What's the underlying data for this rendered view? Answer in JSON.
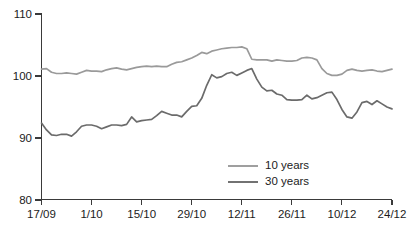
{
  "chart_data": {
    "type": "line",
    "title": "",
    "subtitle": "",
    "xlabel": "",
    "ylabel": "",
    "ylim": [
      80,
      110
    ],
    "yticks": [
      80,
      90,
      100,
      110
    ],
    "ytick_labels": [
      "80",
      "90",
      "100",
      "110"
    ],
    "grid": false,
    "legend_position": "inside-bottom-center",
    "xtick_labels": [
      "17/09",
      "1/10",
      "15/10",
      "29/10",
      "12/11",
      "26/11",
      "10/12",
      "24/12"
    ],
    "xtick_index": [
      0,
      10,
      20,
      30,
      40,
      50,
      60,
      70
    ],
    "x_count": 71,
    "series": [
      {
        "name": "10 years",
        "color": "#9a9a9a",
        "values": [
          101.1,
          101.2,
          100.6,
          100.4,
          100.4,
          100.5,
          100.4,
          100.3,
          100.6,
          100.9,
          100.8,
          100.8,
          100.7,
          101.0,
          101.2,
          101.3,
          101.1,
          101.0,
          101.2,
          101.4,
          101.5,
          101.6,
          101.5,
          101.6,
          101.5,
          101.5,
          101.9,
          102.2,
          102.3,
          102.6,
          102.9,
          103.3,
          103.8,
          103.6,
          104.0,
          104.2,
          104.4,
          104.5,
          104.6,
          104.6,
          104.7,
          104.4,
          102.7,
          102.6,
          102.6,
          102.6,
          102.4,
          102.6,
          102.5,
          102.4,
          102.4,
          102.5,
          102.9,
          103.0,
          102.9,
          102.6,
          101.2,
          100.4,
          100.1,
          100.1,
          100.3,
          100.9,
          101.1,
          100.9,
          100.8,
          100.9,
          101.0,
          100.8,
          100.7,
          100.9,
          101.1
        ]
      },
      {
        "name": "30 years",
        "color": "#6b6b6b",
        "values": [
          92.4,
          91.3,
          90.5,
          90.4,
          90.6,
          90.6,
          90.3,
          91.0,
          91.9,
          92.1,
          92.1,
          91.9,
          91.5,
          91.8,
          92.1,
          92.1,
          92.0,
          92.2,
          93.4,
          92.6,
          92.8,
          92.9,
          93.0,
          93.6,
          94.3,
          94.0,
          93.7,
          93.7,
          93.4,
          94.3,
          95.1,
          95.2,
          96.4,
          98.5,
          100.2,
          99.7,
          99.9,
          100.4,
          100.6,
          100.1,
          100.5,
          100.9,
          101.2,
          99.5,
          98.2,
          97.6,
          97.7,
          97.1,
          96.9,
          96.2,
          96.1,
          96.1,
          96.2,
          96.9,
          96.3,
          96.5,
          96.9,
          97.3,
          97.4,
          96.2,
          94.6,
          93.4,
          93.2,
          94.2,
          95.7,
          95.9,
          95.4,
          96.0,
          95.5,
          95.0,
          94.7
        ]
      }
    ]
  },
  "legend": {
    "items": [
      {
        "label": "10 years",
        "color": "#9a9a9a"
      },
      {
        "label": "30 years",
        "color": "#6b6b6b"
      }
    ]
  }
}
